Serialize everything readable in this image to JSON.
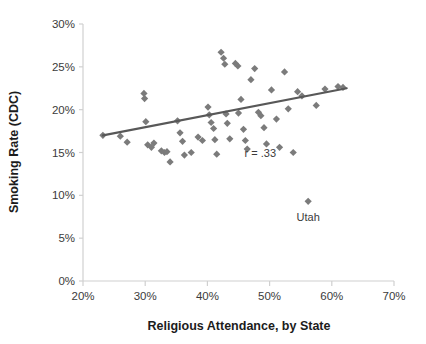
{
  "chart_data": {
    "type": "scatter",
    "title": "",
    "xlabel": "Religious Attendance, by State",
    "ylabel": "Smoking Rate (CDC)",
    "xlim": [
      20,
      70
    ],
    "ylim": [
      0,
      30
    ],
    "xticks": [
      20,
      30,
      40,
      50,
      60,
      70
    ],
    "yticks": [
      0,
      5,
      10,
      15,
      20,
      25,
      30
    ],
    "xtick_labels": [
      "20%",
      "30%",
      "40%",
      "50%",
      "60%",
      "70%"
    ],
    "ytick_labels": [
      "0%",
      "5%",
      "10%",
      "15%",
      "20%",
      "25%",
      "30%"
    ],
    "grid": false,
    "legend": "none",
    "marker_shape": "diamond",
    "marker_color": "#7b7b7b",
    "axis_color": "#d0d0d0",
    "trendline": {
      "color": "#585858",
      "x0": 23.2,
      "y0": 17.0,
      "x1": 62.4,
      "y1": 22.5
    },
    "annotations": [
      {
        "text": "r = .33",
        "x": 48.5,
        "y": 14.5
      },
      {
        "text": "Utah",
        "x": 56.2,
        "y": 7.0
      }
    ],
    "points": [
      {
        "x": 23.2,
        "y": 17.0
      },
      {
        "x": 26.0,
        "y": 16.9
      },
      {
        "x": 27.1,
        "y": 16.2
      },
      {
        "x": 29.8,
        "y": 21.9
      },
      {
        "x": 29.9,
        "y": 21.3
      },
      {
        "x": 30.1,
        "y": 18.6
      },
      {
        "x": 30.4,
        "y": 15.9
      },
      {
        "x": 31.0,
        "y": 15.6
      },
      {
        "x": 31.4,
        "y": 16.1
      },
      {
        "x": 32.6,
        "y": 15.2
      },
      {
        "x": 33.1,
        "y": 15.0
      },
      {
        "x": 33.5,
        "y": 15.1
      },
      {
        "x": 34.0,
        "y": 13.9
      },
      {
        "x": 35.2,
        "y": 18.7
      },
      {
        "x": 35.6,
        "y": 17.3
      },
      {
        "x": 36.0,
        "y": 16.3
      },
      {
        "x": 36.3,
        "y": 14.7
      },
      {
        "x": 37.4,
        "y": 15.0
      },
      {
        "x": 38.5,
        "y": 16.8
      },
      {
        "x": 39.2,
        "y": 16.4
      },
      {
        "x": 40.1,
        "y": 20.3
      },
      {
        "x": 40.3,
        "y": 19.4
      },
      {
        "x": 40.6,
        "y": 18.5
      },
      {
        "x": 41.0,
        "y": 17.8
      },
      {
        "x": 41.2,
        "y": 16.5
      },
      {
        "x": 41.5,
        "y": 14.8
      },
      {
        "x": 42.2,
        "y": 26.7
      },
      {
        "x": 42.6,
        "y": 26.0
      },
      {
        "x": 42.8,
        "y": 25.3
      },
      {
        "x": 43.0,
        "y": 19.5
      },
      {
        "x": 43.2,
        "y": 18.4
      },
      {
        "x": 43.6,
        "y": 16.6
      },
      {
        "x": 44.5,
        "y": 25.4
      },
      {
        "x": 44.9,
        "y": 25.1
      },
      {
        "x": 45.0,
        "y": 19.6
      },
      {
        "x": 45.4,
        "y": 21.2
      },
      {
        "x": 45.8,
        "y": 17.7
      },
      {
        "x": 46.1,
        "y": 16.4
      },
      {
        "x": 46.4,
        "y": 15.4
      },
      {
        "x": 47.0,
        "y": 23.5
      },
      {
        "x": 47.6,
        "y": 24.8
      },
      {
        "x": 48.2,
        "y": 19.7
      },
      {
        "x": 48.6,
        "y": 19.3
      },
      {
        "x": 49.1,
        "y": 17.9
      },
      {
        "x": 49.5,
        "y": 16.0
      },
      {
        "x": 50.3,
        "y": 22.3
      },
      {
        "x": 51.1,
        "y": 18.9
      },
      {
        "x": 51.6,
        "y": 15.6
      },
      {
        "x": 52.4,
        "y": 24.4
      },
      {
        "x": 53.0,
        "y": 20.1
      },
      {
        "x": 53.8,
        "y": 15.0
      },
      {
        "x": 54.5,
        "y": 22.1
      },
      {
        "x": 55.2,
        "y": 21.6
      },
      {
        "x": 56.2,
        "y": 9.3
      },
      {
        "x": 57.5,
        "y": 20.5
      },
      {
        "x": 58.9,
        "y": 22.4
      },
      {
        "x": 61.0,
        "y": 22.7
      },
      {
        "x": 61.8,
        "y": 22.6
      }
    ]
  }
}
